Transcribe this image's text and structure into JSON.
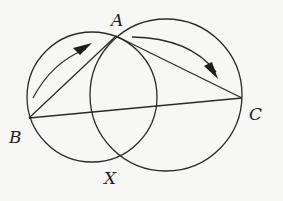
{
  "diagram": {
    "type": "geometry",
    "points": {
      "A": {
        "label": "A",
        "x": 116,
        "y": 36,
        "label_x": 111,
        "label_y": 26
      },
      "B": {
        "label": "B",
        "x": 29,
        "y": 118,
        "label_x": 9,
        "label_y": 143
      },
      "C": {
        "label": "C",
        "x": 242,
        "y": 98,
        "label_x": 249,
        "label_y": 120
      },
      "X": {
        "label": "X",
        "x": 122,
        "y": 156,
        "label_x": 104,
        "label_y": 184
      }
    },
    "circles": [
      {
        "name": "left-circle",
        "cx": 92,
        "cy": 97,
        "r": 65
      },
      {
        "name": "right-circle",
        "cx": 166,
        "cy": 95,
        "r": 76
      }
    ],
    "segments": [
      {
        "name": "segment-BA",
        "from": "B",
        "to": "A"
      },
      {
        "name": "segment-AC",
        "from": "A",
        "to": "C"
      },
      {
        "name": "segment-BC",
        "from": "B",
        "to": "C"
      }
    ],
    "arrows": [
      {
        "name": "arrow-B-to-A",
        "direction": "from B toward A"
      },
      {
        "name": "arrow-A-to-C",
        "direction": "from A toward C"
      }
    ],
    "colors": {
      "stroke": "#2a2a2a",
      "background": "#f7f7f5"
    }
  }
}
